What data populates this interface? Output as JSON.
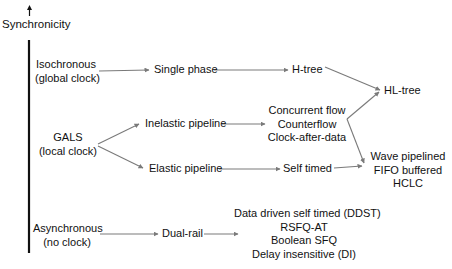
{
  "axis": {
    "label": "Synchronicity"
  },
  "categories": {
    "isochronous": {
      "line1": "Isochronous",
      "line2": "(global clock)"
    },
    "gals": {
      "line1": "GALS",
      "line2": "(local clock)"
    },
    "asynchronous": {
      "line1": "Asynchronous",
      "line2": "(no clock)"
    }
  },
  "nodes": {
    "single_phase": "Single phase",
    "h_tree": "H-tree",
    "hl_tree": "HL-tree",
    "inelastic_pipeline": "Inelastic pipeline",
    "elastic_pipeline": "Elastic pipeline",
    "inelastic_group": [
      "Concurrent flow",
      "Counterflow",
      "Clock-after-data"
    ],
    "self_timed": "Self timed",
    "wave_group": [
      "Wave pipelined",
      "FIFO buffered",
      "HCLC"
    ],
    "dual_rail": "Dual-rail",
    "async_group": [
      "Data driven self timed (DDST)",
      "RSFQ-AT",
      "Boolean SFQ",
      "Delay insensitive (DI)"
    ]
  },
  "colors": {
    "arrow": "#7a7a7a",
    "axis": "#111111",
    "text": "#111111"
  }
}
